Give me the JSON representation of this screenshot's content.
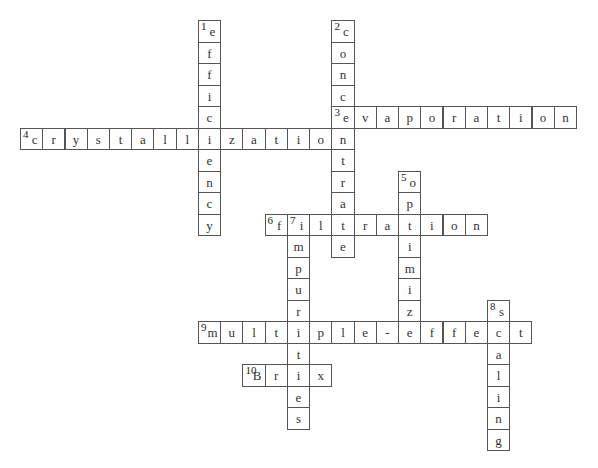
{
  "puzzle": {
    "grid": {
      "origin_x": 20,
      "origin_y": 20,
      "cell_w": 22.24,
      "cell_h": 21.5
    },
    "colors": {
      "border": "#555555",
      "text": "#333333",
      "background": "#ffffff"
    },
    "words": [
      {
        "number": "1",
        "direction": "down",
        "answer": "efficiency",
        "row": 0,
        "col": 8
      },
      {
        "number": "2",
        "direction": "down",
        "answer": "concentrate",
        "row": 0,
        "col": 14
      },
      {
        "number": "3",
        "direction": "across",
        "answer": "evaporation",
        "row": 4,
        "col": 14
      },
      {
        "number": "4",
        "direction": "across",
        "answer": "crystallization",
        "row": 5,
        "col": 0
      },
      {
        "number": "5",
        "direction": "down",
        "answer": "optimize",
        "row": 7,
        "col": 17
      },
      {
        "number": "6",
        "direction": "across",
        "answer": "filtration",
        "row": 9,
        "col": 11
      },
      {
        "number": "7",
        "direction": "down",
        "answer": "impurities",
        "row": 9,
        "col": 12
      },
      {
        "number": "8",
        "direction": "down",
        "answer": "scaling",
        "row": 13,
        "col": 21
      },
      {
        "number": "9",
        "direction": "across",
        "answer": "multiple-effect",
        "row": 14,
        "col": 8
      },
      {
        "number": "10",
        "direction": "across",
        "answer": "Brix",
        "row": 16,
        "col": 10
      }
    ]
  }
}
